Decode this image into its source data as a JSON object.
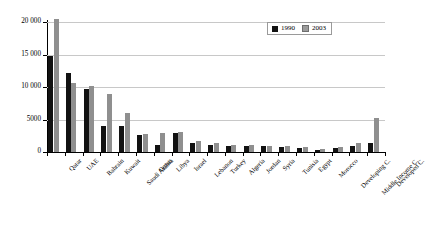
{
  "chart_data": {
    "type": "bar",
    "title": "",
    "xlabel": "",
    "ylabel": "",
    "ylim": [
      0,
      20000
    ],
    "yticks": [
      0,
      5000,
      10000,
      15000,
      20000
    ],
    "ytick_labels": [
      "0",
      "5000",
      "10 000",
      "15 000",
      "20 000"
    ],
    "grid": true,
    "legend_position": "top-right",
    "categories": [
      "Qatar",
      "UAE",
      "Bahrain",
      "Kuwait",
      "Saudi Arabia",
      "Oman",
      "Libya",
      "Israel",
      "Lebanon",
      "Turkey",
      "Algeria",
      "Jordan",
      "Syria",
      "Tunisia",
      "Egypt",
      "Morocco",
      "Developing C.",
      "Middle Income C.",
      "Developed C."
    ],
    "series": [
      {
        "name": "1990",
        "color": "#121212",
        "values": [
          14700,
          12100,
          9700,
          4050,
          4000,
          2650,
          1050,
          2950,
          1350,
          1150,
          960,
          900,
          900,
          740,
          620,
          330,
          580,
          1000,
          1450
        ]
      },
      {
        "name": "2003",
        "color": "#8f8f8f",
        "values": [
          20450,
          10550,
          10200,
          8950,
          5950,
          2700,
          2900,
          3050,
          1700,
          1450,
          1050,
          1020,
          1000,
          880,
          800,
          420,
          800,
          1450,
          5200
        ]
      }
    ]
  },
  "legend": {
    "items": [
      {
        "label": "1990",
        "color": "#121212"
      },
      {
        "label": "2003",
        "color": "#9b9b9b"
      }
    ]
  }
}
